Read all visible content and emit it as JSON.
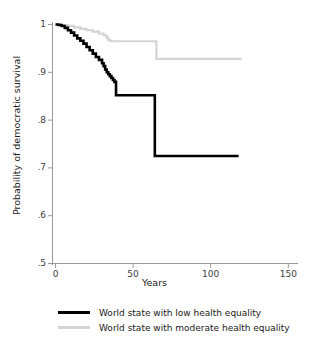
{
  "chart_data": {
    "type": "line",
    "subtype": "kaplan-meier-survival-step",
    "title": "",
    "xlabel": "Years",
    "ylabel": "Probability of democratic survival",
    "xlim": [
      0,
      150
    ],
    "ylim": [
      0.5,
      1.0
    ],
    "xticks": [
      0,
      50,
      100,
      150
    ],
    "xtick_labels": [
      "0",
      "50",
      "100",
      "150"
    ],
    "yticks": [
      0.5,
      0.6,
      0.7,
      0.8,
      0.9,
      1.0
    ],
    "ytick_labels": [
      ".5",
      ".6",
      ".7",
      ".8",
      ".9",
      "1"
    ],
    "grid": false,
    "legend_position": "below",
    "series": [
      {
        "name": "World state with low health equality",
        "color": "#000000",
        "line_width": 2.6,
        "x": [
          0,
          2,
          4,
          6,
          8,
          10,
          12,
          14,
          16,
          18,
          20,
          22,
          24,
          26,
          28,
          30,
          31,
          32,
          33,
          34,
          35,
          36,
          37,
          38,
          39,
          63,
          64,
          118
        ],
        "y": [
          1.0,
          0.999,
          0.997,
          0.993,
          0.988,
          0.983,
          0.977,
          0.971,
          0.966,
          0.96,
          0.953,
          0.946,
          0.939,
          0.932,
          0.926,
          0.919,
          0.913,
          0.906,
          0.9,
          0.896,
          0.892,
          0.888,
          0.884,
          0.88,
          0.852,
          0.852,
          0.725,
          0.725
        ]
      },
      {
        "name": "World state with moderate health equality",
        "color": "#d4d4d4",
        "line_width": 2.2,
        "x": [
          0,
          4,
          8,
          12,
          16,
          20,
          24,
          28,
          31,
          33,
          34,
          35,
          36,
          40,
          64,
          65,
          120
        ],
        "y": [
          1.0,
          0.999,
          0.997,
          0.994,
          0.991,
          0.988,
          0.985,
          0.981,
          0.977,
          0.972,
          0.968,
          0.966,
          0.965,
          0.965,
          0.965,
          0.928,
          0.928
        ]
      }
    ],
    "annotations": []
  },
  "axes": {
    "x_title": "Years",
    "y_title": "Probability of democratic survival",
    "x_tick_labels": [
      "0",
      "50",
      "100",
      "150"
    ],
    "y_tick_labels": [
      "1",
      ".9",
      ".8",
      ".7",
      ".6",
      ".5"
    ]
  },
  "legend": {
    "items": [
      {
        "label": "World state with low health equality",
        "color": "#000000"
      },
      {
        "label": "World state with moderate health equality",
        "color": "#d4d4d4"
      }
    ]
  },
  "colors": {
    "low_equality_line": "#000000",
    "moderate_equality_line": "#d4d4d4",
    "axis": "#9a9a9a",
    "text": "#1a1a1a",
    "background": "#ffffff"
  }
}
